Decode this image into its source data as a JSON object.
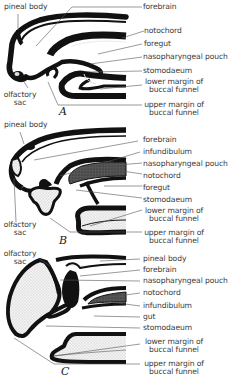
{
  "figure": {
    "panels": [
      {
        "id": "A",
        "caption": "A",
        "left_labels": {
          "top": "pineal body",
          "bottom_line1": "olfactory",
          "bottom_line2": "sac"
        },
        "right_labels": [
          "forebrain",
          "notochord",
          "foregut",
          "nasopharyngeal pouch",
          "stomodaeum",
          "lower margin of",
          "buccal funnel",
          "upper margin of",
          "buccal funnel"
        ]
      },
      {
        "id": "B",
        "caption": "B",
        "left_labels": {
          "top": "pineal body",
          "bottom_line1": "olfactory",
          "bottom_line2": "sac"
        },
        "right_labels": [
          "forebrain",
          "infundibulum",
          "nasopharyngeal pouch",
          "notochord",
          "foregut",
          "stomodaeum",
          "lower margin of",
          "buccal funnel",
          "upper margin of",
          "buccal funnel"
        ]
      },
      {
        "id": "C",
        "caption": "C",
        "left_labels": {
          "top_line1": "olfactory",
          "top_line2": "sac"
        },
        "right_labels": [
          "pineal body",
          "forebrain",
          "nasopharyngeal pouch",
          "notochord",
          "infundibulum",
          "gut",
          "stomodaeum",
          "lower margin of",
          "buccal funnel",
          "upper margin of",
          "buccal funnel"
        ]
      }
    ],
    "colors": {
      "tissue": "#111111",
      "stipple": "#e4e4e4",
      "leader": "#555555",
      "text": "#3a3a3a"
    }
  }
}
